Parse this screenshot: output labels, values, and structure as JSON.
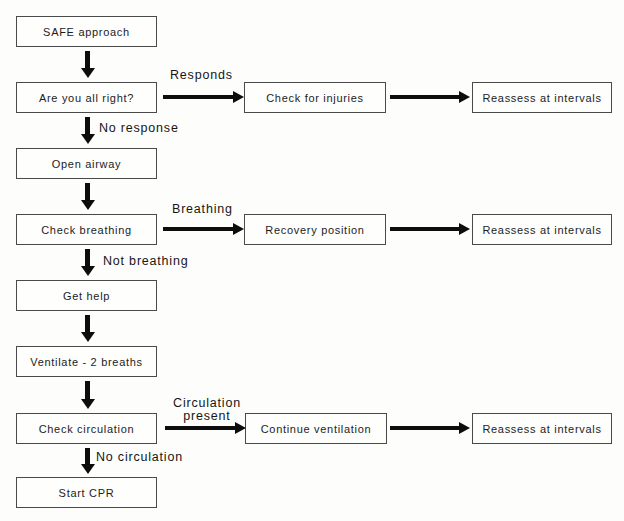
{
  "flowchart": {
    "description": "Basic life support (CPR) decision flowchart",
    "colors": {
      "background": "#fdfdfb",
      "box_border": "#4a4a4a",
      "box_fill": "#fefefd",
      "arrow": "#0d0d0d",
      "text": "#1c1c1c"
    },
    "nodes": {
      "safe_approach": "SAFE approach",
      "are_you_all_right": "Are you all right?",
      "open_airway": "Open airway",
      "check_breathing": "Check breathing",
      "get_help": "Get help",
      "ventilate": "Ventilate - 2 breaths",
      "check_circulation": "Check circulation",
      "start_cpr": "Start CPR",
      "check_for_injuries": "Check for injuries",
      "recovery_position": "Recovery position",
      "continue_ventilation": "Continue ventilation",
      "reassess_1": "Reassess at intervals",
      "reassess_2": "Reassess at intervals",
      "reassess_3": "Reassess at intervals"
    },
    "edge_labels": {
      "responds": "Responds",
      "no_response": "No response",
      "breathing": "Breathing",
      "not_breathing": "Not breathing",
      "circulation_present_line1": "Circulation",
      "circulation_present_line2": "present",
      "no_circulation": "No circulation"
    }
  }
}
